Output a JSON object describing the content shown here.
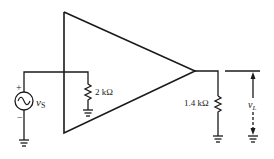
{
  "diagram": {
    "type": "amplifier-circuit",
    "source": {
      "label": "v",
      "subscript": "S",
      "plus": "+",
      "minus": "−"
    },
    "input_resistor": {
      "label": "2 kΩ"
    },
    "load_resistor": {
      "label": "1.4 kΩ"
    },
    "output_voltage": {
      "label": "v",
      "subscript": "L"
    },
    "colors": {
      "stroke": "#1a1a1a",
      "background": "#ffffff"
    }
  }
}
